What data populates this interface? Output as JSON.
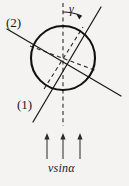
{
  "figure": {
    "kind": "physics-refraction-diagram",
    "background_color": "#f4f3f1",
    "ink_color": "#1a1a1a",
    "labels": {
      "line_two": "(2)",
      "line_one": "(1)",
      "angle_gamma": "γ",
      "velocity_component": "vsinα"
    },
    "geometry": {
      "circle": {
        "center_x": 63,
        "center_y": 58,
        "radius": 32,
        "stroke_width": 2.0
      },
      "solid_lines": [
        {
          "name": "line-2-ray",
          "x1": 7,
          "y1": 29,
          "x2": 121,
          "y2": 96
        },
        {
          "name": "line-1-ray",
          "x1": 101,
          "y1": 7,
          "x2": 33,
          "y2": 122
        }
      ],
      "dashed_lines": [
        {
          "name": "vertical-axis",
          "x1": 63,
          "y1": 3,
          "x2": 63,
          "y2": 126
        },
        {
          "name": "diagonal-axis-a",
          "x1": 30,
          "y1": 46,
          "x2": 97,
          "y2": 71
        },
        {
          "name": "diagonal-axis-b",
          "x1": 44,
          "y1": 88,
          "x2": 83,
          "y2": 28
        }
      ],
      "angle_arc": {
        "name": "gamma-arc",
        "center_x": 63,
        "center_y": 58,
        "radius": 46,
        "start_deg": 90,
        "end_deg": 66,
        "arrowhead": true
      },
      "up_arrows": [
        {
          "x": 47,
          "y_tail": 159,
          "y_head": 134
        },
        {
          "x": 63,
          "y_tail": 159,
          "y_head": 134
        },
        {
          "x": 80,
          "y_tail": 159,
          "y_head": 134
        }
      ]
    }
  }
}
